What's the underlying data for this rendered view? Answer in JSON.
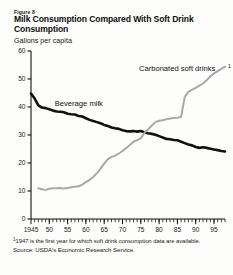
{
  "figure": {
    "number_label": "Figure 8",
    "title": "Milk Consumption Compared With Soft Drink Consumption",
    "unit_label": "Gallons per capita",
    "footnote": "1947 is the first year for which soft drink consumption data are available.",
    "footnote_marker": "1",
    "source": "Source:  USDA's Economic Research Service."
  },
  "chart_data": {
    "type": "line",
    "title": "Milk Consumption Compared With Soft Drink Consumption",
    "subtitle": "Figure 8",
    "xlabel": "",
    "ylabel": "Gallons per capita",
    "xlim": [
      1945,
      1998
    ],
    "ylim": [
      0,
      60
    ],
    "ytick_values": [
      0,
      10,
      20,
      30,
      40,
      50,
      60
    ],
    "ytick_labels": [
      "0",
      "10",
      "20",
      "30",
      "40",
      "50",
      "60"
    ],
    "xtick_values": [
      1945,
      1950,
      1955,
      1960,
      1965,
      1970,
      1975,
      1980,
      1985,
      1990,
      1995
    ],
    "xtick_labels": [
      "1945",
      "50",
      "55",
      "60",
      "65",
      "70",
      "75",
      "80",
      "85",
      "90",
      "95"
    ],
    "minor_xticks": true,
    "grid": false,
    "legend_position": "inline-annotations",
    "series": [
      {
        "name": "Beverage milk",
        "color": "#111111",
        "line_width": 2.6,
        "x": [
          1945,
          1946,
          1947,
          1948,
          1949,
          1950,
          1951,
          1952,
          1953,
          1954,
          1955,
          1956,
          1957,
          1958,
          1959,
          1960,
          1961,
          1962,
          1963,
          1964,
          1965,
          1966,
          1967,
          1968,
          1969,
          1970,
          1971,
          1972,
          1973,
          1974,
          1975,
          1976,
          1977,
          1978,
          1979,
          1980,
          1981,
          1982,
          1983,
          1984,
          1985,
          1986,
          1987,
          1988,
          1989,
          1990,
          1991,
          1992,
          1993,
          1994,
          1995,
          1996,
          1997,
          1998
        ],
        "values": [
          44.8,
          43.0,
          40.6,
          39.8,
          39.6,
          39.2,
          38.7,
          38.4,
          38.3,
          38.1,
          37.6,
          37.4,
          37.3,
          36.8,
          36.6,
          36.0,
          35.4,
          35.0,
          34.6,
          34.2,
          33.6,
          33.2,
          32.7,
          32.4,
          32.2,
          31.7,
          31.4,
          31.3,
          31.4,
          31.2,
          31.4,
          31.0,
          30.6,
          30.4,
          30.1,
          29.6,
          29.1,
          28.6,
          28.5,
          28.2,
          28.1,
          27.6,
          27.1,
          26.6,
          26.3,
          25.7,
          25.4,
          25.6,
          25.4,
          25.1,
          24.8,
          24.6,
          24.3,
          24.1
        ]
      },
      {
        "name": "Carbonated soft drinks",
        "name_marker": "1",
        "color": "#a8a8a8",
        "line_width": 2.0,
        "x": [
          1947,
          1948,
          1949,
          1950,
          1951,
          1952,
          1953,
          1954,
          1955,
          1956,
          1957,
          1958,
          1959,
          1960,
          1961,
          1962,
          1963,
          1964,
          1965,
          1966,
          1967,
          1968,
          1969,
          1970,
          1971,
          1972,
          1973,
          1974,
          1975,
          1976,
          1977,
          1978,
          1979,
          1980,
          1981,
          1982,
          1983,
          1984,
          1985,
          1986,
          1987,
          1988,
          1989,
          1990,
          1991,
          1992,
          1993,
          1994,
          1995,
          1996,
          1997,
          1998
        ],
        "values": [
          11.0,
          10.6,
          10.4,
          10.8,
          11.0,
          11.0,
          11.1,
          10.9,
          11.1,
          11.3,
          11.5,
          11.7,
          12.3,
          13.2,
          14.0,
          15.0,
          16.4,
          18.0,
          19.8,
          21.4,
          22.2,
          22.6,
          23.4,
          24.3,
          25.3,
          26.4,
          27.6,
          28.2,
          28.8,
          30.8,
          32.0,
          33.4,
          34.6,
          35.1,
          35.3,
          35.6,
          35.9,
          36.1,
          36.2,
          36.4,
          43.6,
          45.4,
          46.2,
          46.8,
          47.6,
          48.4,
          49.6,
          51.0,
          52.0,
          52.8,
          53.6,
          54.4
        ]
      }
    ],
    "annotations": [
      {
        "text": "Beverage milk",
        "x": 1951.5,
        "y": 40.5
      },
      {
        "text": "Carbonated soft drinks",
        "marker": "1",
        "x": 1974.5,
        "y": 53.0
      }
    ]
  }
}
